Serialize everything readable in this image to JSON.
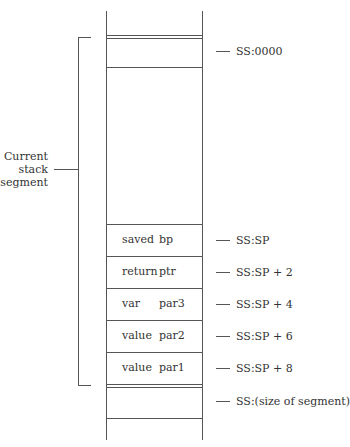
{
  "bracket_label": [
    "Current",
    "stack",
    "segment"
  ],
  "cells": [
    {
      "a": "saved",
      "b": "bp"
    },
    {
      "a": "return",
      "b": "ptr"
    },
    {
      "a": "var",
      "b": "par3"
    },
    {
      "a": "value",
      "b": "par2"
    },
    {
      "a": "value",
      "b": "par1"
    }
  ],
  "addresses": [
    "SS:0000",
    "SS:SP",
    "SS:SP + 2",
    "SS:SP + 4",
    "SS:SP + 6",
    "SS:SP + 8",
    "SS:(size of segment)"
  ]
}
